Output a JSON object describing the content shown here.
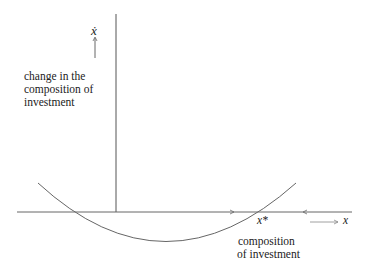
{
  "diagram": {
    "y_axis_symbol": "ẋ",
    "y_axis_label": [
      "change in the",
      "composition of",
      "investment"
    ],
    "x_axis_symbol": "x",
    "x_axis_label": [
      "composition",
      "of investment"
    ],
    "equilibrium_label": "x*",
    "curve": "U-shaped parabola crossing x axis twice; right crossing is x*",
    "flow_arrows": [
      "right-pointing arrow left of x*",
      "left-pointing arrow right of x*"
    ]
  }
}
